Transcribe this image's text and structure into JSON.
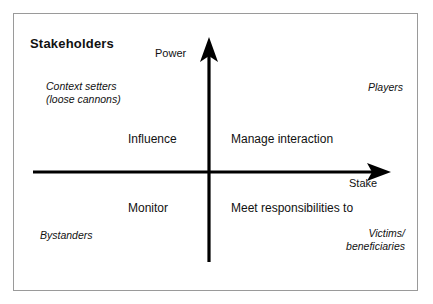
{
  "diagram": {
    "title": "Stakeholders",
    "axes": {
      "vertical_label": "Power",
      "horizontal_label": "Stake"
    },
    "quadrant_labels": {
      "top_left": "Context setters\n(loose cannons)",
      "top_left_line1": "Context setters",
      "top_left_line2": "(loose cannons)",
      "top_right": "Players",
      "bottom_left": "Bystanders",
      "bottom_right_line1": "Victims/",
      "bottom_right_line2": "beneficiaries"
    },
    "action_labels": {
      "upper_left": "Influence",
      "upper_right": "Manage interaction",
      "lower_left": "Monitor",
      "lower_right": "Meet responsibilities to"
    },
    "colors": {
      "background": "#ffffff",
      "frame_border": "#9a9a9a",
      "axis": "#000000",
      "text": "#111111"
    }
  }
}
